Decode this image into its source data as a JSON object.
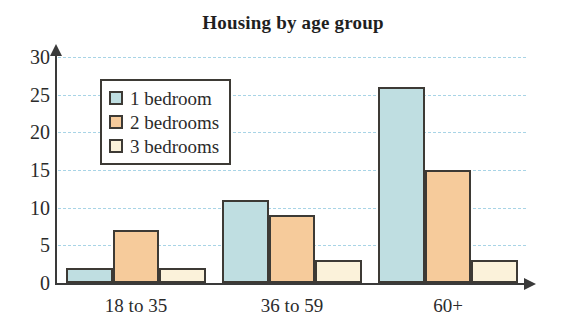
{
  "chart_data": {
    "type": "bar",
    "title": "Housing by age group",
    "xlabel": "",
    "ylabel": "",
    "categories": [
      "18 to 35",
      "36 to 59",
      "60+"
    ],
    "series": [
      {
        "name": "1 bedroom",
        "color": "#bfdee1",
        "values": [
          2,
          11,
          26
        ]
      },
      {
        "name": "2 bedrooms",
        "color": "#f6cb9b",
        "values": [
          7,
          9,
          15
        ]
      },
      {
        "name": "3 bedrooms",
        "color": "#fbf2da",
        "values": [
          2,
          3,
          3
        ]
      }
    ],
    "ylim": [
      0,
      30
    ],
    "yticks": [
      0,
      5,
      10,
      15,
      20,
      25,
      30
    ],
    "ytick_labels": [
      "0",
      "5",
      "10",
      "15",
      "20",
      "25",
      "30"
    ],
    "grid": true,
    "grid_color": "#a8d4e6",
    "legend_position": "upper-left",
    "axis_color": "#3a3a3a",
    "bar_border_color": "#3d3a35",
    "background": "#ffffff"
  }
}
